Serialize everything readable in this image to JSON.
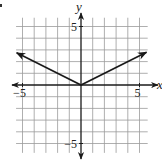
{
  "chart_data": {
    "type": "line",
    "title": "",
    "xlabel": "x",
    "ylabel": "y",
    "xlim": [
      -5.5,
      5.5
    ],
    "ylim": [
      -5.5,
      5.5
    ],
    "grid": true,
    "grid_step": 1,
    "tick_labels": {
      "x": [
        {
          "value": -5,
          "label": "−5"
        },
        {
          "value": 5,
          "label": "5"
        }
      ],
      "y": [
        {
          "value": 5,
          "label": "5"
        },
        {
          "value": -5,
          "label": "−5"
        }
      ]
    },
    "series": [
      {
        "name": "y = |x|/2",
        "points": [
          [
            -5.5,
            2.75
          ],
          [
            0,
            0
          ],
          [
            5.6,
            2.8
          ]
        ],
        "arrows_at_ends": true
      }
    ]
  },
  "colors": {
    "grid": "#9a9a9a",
    "axis": "#1a1a1a",
    "curve": "#1a1a1a"
  }
}
